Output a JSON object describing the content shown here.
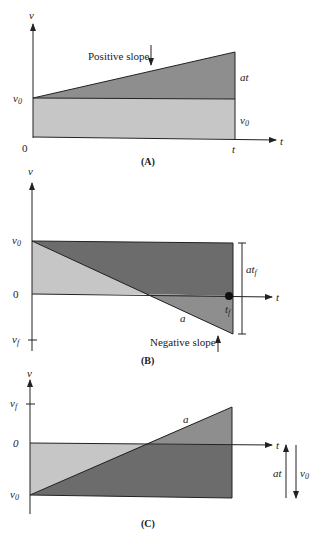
{
  "colors": {
    "light": "#c6c6c6",
    "mid": "#8e8e8e",
    "dark": "#6c6c6c",
    "line": "#222222"
  },
  "panelA": {
    "caption": "(A)",
    "y_axis_label": "v",
    "x_axis_label": "t",
    "origin_label": "0",
    "v0_label": "v",
    "v0_sub": "0",
    "t_tick_label": "t",
    "annotation": "Positive slope",
    "region_upper_label": "at",
    "region_lower_label": "v",
    "region_lower_sub": "0"
  },
  "panelB": {
    "caption": "(B)",
    "y_axis_label": "v",
    "x_axis_label": "t",
    "zero_label": "0",
    "v0_label": "v",
    "v0_sub": "0",
    "vf_label": "v",
    "vf_sub": "f",
    "tf_label": "t",
    "tf_sub": "f",
    "slope_label": "a",
    "bracket_label": "at",
    "bracket_sub": "f",
    "annotation": "Negative slope"
  },
  "panelC": {
    "caption": "(C)",
    "y_axis_label": "v",
    "x_axis_label": "t",
    "zero_label": "0",
    "v0_label": "v",
    "v0_sub": "0",
    "vf_label": "v",
    "vf_sub": "f",
    "slope_label": "a",
    "arrow_up_label": "at",
    "arrow_down_label": "v",
    "arrow_down_sub": "0"
  }
}
